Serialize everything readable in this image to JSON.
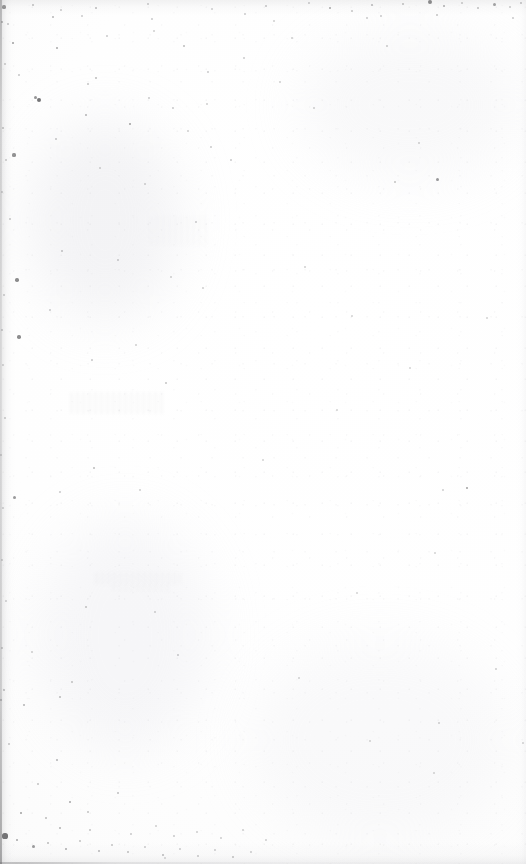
{
  "page": {
    "kind": "scanned-blank-page",
    "width": 526,
    "height": 864,
    "visible_text": "",
    "text_content_present": false
  },
  "colors": {
    "paper_white": "#fefefe",
    "paper_offwhite": "#fafafa",
    "speck_dark": "#3b3b3d",
    "speck_mid": "#8a8a8d",
    "speck_light": "#c4c4c8",
    "edge_shadow": "#96969a",
    "ghost_smudge": "#d8d8dc"
  },
  "artifacts": {
    "left_gutter_shadow": true,
    "top_dust_band": true,
    "bottom_edge_band": true,
    "right_edge_faint": true,
    "ghost_smudges": [
      {
        "x": 70,
        "y": 392,
        "w": 96,
        "h": 22,
        "opacity": 0.16
      },
      {
        "x": 95,
        "y": 572,
        "w": 86,
        "h": 13,
        "opacity": 0.14
      },
      {
        "x": 112,
        "y": 584,
        "w": 58,
        "h": 8,
        "opacity": 0.1
      },
      {
        "x": 150,
        "y": 216,
        "w": 60,
        "h": 30,
        "opacity": 0.08
      }
    ],
    "blotches": [
      {
        "x": 30,
        "y": 120,
        "w": 150,
        "h": 200,
        "color": "rgba(228,228,232,0.40)"
      },
      {
        "x": 40,
        "y": 520,
        "w": 170,
        "h": 230,
        "color": "rgba(232,232,236,0.34)"
      },
      {
        "x": 300,
        "y": 30,
        "w": 220,
        "h": 150,
        "color": "rgba(234,234,238,0.30)"
      },
      {
        "x": 250,
        "y": 640,
        "w": 260,
        "h": 200,
        "color": "rgba(236,236,240,0.26)"
      }
    ],
    "specks": [
      {
        "x": 4,
        "y": 7,
        "r": 1.6,
        "o": 0.62
      },
      {
        "x": 33,
        "y": 5,
        "r": 1.0,
        "o": 0.34
      },
      {
        "x": 61,
        "y": 10,
        "r": 0.9,
        "o": 0.28
      },
      {
        "x": 96,
        "y": 8,
        "r": 1.1,
        "o": 0.36
      },
      {
        "x": 148,
        "y": 4,
        "r": 1.0,
        "o": 0.3
      },
      {
        "x": 212,
        "y": 9,
        "r": 0.8,
        "o": 0.24
      },
      {
        "x": 266,
        "y": 6,
        "r": 1.0,
        "o": 0.32
      },
      {
        "x": 309,
        "y": 3,
        "r": 0.9,
        "o": 0.28
      },
      {
        "x": 330,
        "y": 8,
        "r": 1.4,
        "o": 0.48
      },
      {
        "x": 352,
        "y": 11,
        "r": 1.0,
        "o": 0.3
      },
      {
        "x": 372,
        "y": 5,
        "r": 1.2,
        "o": 0.38
      },
      {
        "x": 403,
        "y": 4,
        "r": 1.1,
        "o": 0.34
      },
      {
        "x": 430,
        "y": 2,
        "r": 1.9,
        "o": 0.64
      },
      {
        "x": 444,
        "y": 6,
        "r": 1.3,
        "o": 0.44
      },
      {
        "x": 462,
        "y": 3,
        "r": 1.0,
        "o": 0.3
      },
      {
        "x": 478,
        "y": 8,
        "r": 1.1,
        "o": 0.34
      },
      {
        "x": 494,
        "y": 4,
        "r": 1.5,
        "o": 0.5
      },
      {
        "x": 510,
        "y": 7,
        "r": 1.0,
        "o": 0.3
      },
      {
        "x": 521,
        "y": 3,
        "r": 1.2,
        "o": 0.36
      },
      {
        "x": 2,
        "y": 22,
        "r": 1.3,
        "o": 0.44
      },
      {
        "x": 8,
        "y": 24,
        "r": 1.0,
        "o": 0.32
      },
      {
        "x": 53,
        "y": 17,
        "r": 1.1,
        "o": 0.36
      },
      {
        "x": 82,
        "y": 16,
        "r": 0.8,
        "o": 0.24
      },
      {
        "x": 152,
        "y": 19,
        "r": 0.9,
        "o": 0.26
      },
      {
        "x": 245,
        "y": 14,
        "r": 0.9,
        "o": 0.26
      },
      {
        "x": 274,
        "y": 21,
        "r": 0.8,
        "o": 0.22
      },
      {
        "x": 367,
        "y": 18,
        "r": 0.8,
        "o": 0.24
      },
      {
        "x": 381,
        "y": 16,
        "r": 0.9,
        "o": 0.26
      },
      {
        "x": 437,
        "y": 15,
        "r": 1.0,
        "o": 0.3
      },
      {
        "x": 513,
        "y": 18,
        "r": 0.9,
        "o": 0.26
      },
      {
        "x": 13,
        "y": 43,
        "r": 1.4,
        "o": 0.5
      },
      {
        "x": 39,
        "y": 100,
        "r": 2.0,
        "o": 0.7
      },
      {
        "x": 19,
        "y": 75,
        "r": 0.9,
        "o": 0.28
      },
      {
        "x": 5,
        "y": 64,
        "r": 1.0,
        "o": 0.3
      },
      {
        "x": 3,
        "y": 128,
        "r": 1.1,
        "o": 0.34
      },
      {
        "x": 14,
        "y": 155,
        "r": 1.6,
        "o": 0.56
      },
      {
        "x": 6,
        "y": 160,
        "r": 1.0,
        "o": 0.3
      },
      {
        "x": 2,
        "y": 192,
        "r": 0.9,
        "o": 0.28
      },
      {
        "x": 10,
        "y": 219,
        "r": 1.0,
        "o": 0.3
      },
      {
        "x": 17,
        "y": 280,
        "r": 1.7,
        "o": 0.58
      },
      {
        "x": 4,
        "y": 295,
        "r": 1.0,
        "o": 0.3
      },
      {
        "x": 2,
        "y": 330,
        "r": 1.1,
        "o": 0.32
      },
      {
        "x": 19,
        "y": 337,
        "r": 1.7,
        "o": 0.58
      },
      {
        "x": 3,
        "y": 365,
        "r": 0.9,
        "o": 0.26
      },
      {
        "x": 5,
        "y": 418,
        "r": 1.0,
        "o": 0.3
      },
      {
        "x": 1,
        "y": 455,
        "r": 0.9,
        "o": 0.28
      },
      {
        "x": 14,
        "y": 497,
        "r": 1.5,
        "o": 0.52
      },
      {
        "x": 3,
        "y": 508,
        "r": 0.9,
        "o": 0.26
      },
      {
        "x": 2,
        "y": 560,
        "r": 1.0,
        "o": 0.28
      },
      {
        "x": 6,
        "y": 601,
        "r": 0.9,
        "o": 0.26
      },
      {
        "x": 2,
        "y": 648,
        "r": 1.1,
        "o": 0.32
      },
      {
        "x": 4,
        "y": 690,
        "r": 1.2,
        "o": 0.36
      },
      {
        "x": 1,
        "y": 700,
        "r": 1.3,
        "o": 0.42
      },
      {
        "x": 9,
        "y": 744,
        "r": 1.0,
        "o": 0.3
      },
      {
        "x": 57,
        "y": 48,
        "r": 1.3,
        "o": 0.44
      },
      {
        "x": 107,
        "y": 36,
        "r": 0.9,
        "o": 0.26
      },
      {
        "x": 154,
        "y": 31,
        "r": 0.8,
        "o": 0.22
      },
      {
        "x": 184,
        "y": 46,
        "r": 1.1,
        "o": 0.34
      },
      {
        "x": 208,
        "y": 72,
        "r": 0.9,
        "o": 0.26
      },
      {
        "x": 244,
        "y": 58,
        "r": 0.8,
        "o": 0.24
      },
      {
        "x": 86,
        "y": 115,
        "r": 1.2,
        "o": 0.38
      },
      {
        "x": 130,
        "y": 124,
        "r": 1.4,
        "o": 0.48
      },
      {
        "x": 173,
        "y": 108,
        "r": 0.9,
        "o": 0.26
      },
      {
        "x": 88,
        "y": 84,
        "r": 1.0,
        "o": 0.3
      },
      {
        "x": 96,
        "y": 78,
        "r": 1.1,
        "o": 0.34
      },
      {
        "x": 188,
        "y": 131,
        "r": 0.8,
        "o": 0.22
      },
      {
        "x": 207,
        "y": 104,
        "r": 0.8,
        "o": 0.22
      },
      {
        "x": 149,
        "y": 98,
        "r": 0.9,
        "o": 0.26
      },
      {
        "x": 35,
        "y": 97,
        "r": 1.5,
        "o": 0.54
      },
      {
        "x": 211,
        "y": 147,
        "r": 0.9,
        "o": 0.26
      },
      {
        "x": 100,
        "y": 168,
        "r": 0.8,
        "o": 0.22
      },
      {
        "x": 56,
        "y": 139,
        "r": 1.0,
        "o": 0.3
      },
      {
        "x": 145,
        "y": 184,
        "r": 0.8,
        "o": 0.22
      },
      {
        "x": 196,
        "y": 222,
        "r": 0.9,
        "o": 0.26
      },
      {
        "x": 62,
        "y": 251,
        "r": 1.0,
        "o": 0.3
      },
      {
        "x": 118,
        "y": 260,
        "r": 0.9,
        "o": 0.26
      },
      {
        "x": 171,
        "y": 277,
        "r": 0.8,
        "o": 0.22
      },
      {
        "x": 203,
        "y": 288,
        "r": 0.8,
        "o": 0.22
      },
      {
        "x": 50,
        "y": 310,
        "r": 0.9,
        "o": 0.26
      },
      {
        "x": 136,
        "y": 345,
        "r": 0.8,
        "o": 0.22
      },
      {
        "x": 92,
        "y": 360,
        "r": 0.9,
        "o": 0.26
      },
      {
        "x": 166,
        "y": 383,
        "r": 1.0,
        "o": 0.3
      },
      {
        "x": 94,
        "y": 468,
        "r": 1.1,
        "o": 0.34
      },
      {
        "x": 60,
        "y": 492,
        "r": 0.9,
        "o": 0.26
      },
      {
        "x": 140,
        "y": 490,
        "r": 0.8,
        "o": 0.22
      },
      {
        "x": 86,
        "y": 607,
        "r": 1.0,
        "o": 0.3
      },
      {
        "x": 155,
        "y": 612,
        "r": 0.8,
        "o": 0.22
      },
      {
        "x": 178,
        "y": 655,
        "r": 0.9,
        "o": 0.26
      },
      {
        "x": 72,
        "y": 682,
        "r": 1.0,
        "o": 0.3
      },
      {
        "x": 231,
        "y": 160,
        "r": 0.9,
        "o": 0.26
      },
      {
        "x": 280,
        "y": 82,
        "r": 0.8,
        "o": 0.22
      },
      {
        "x": 314,
        "y": 108,
        "r": 0.8,
        "o": 0.22
      },
      {
        "x": 387,
        "y": 46,
        "r": 0.9,
        "o": 0.26
      },
      {
        "x": 292,
        "y": 38,
        "r": 0.8,
        "o": 0.22
      },
      {
        "x": 419,
        "y": 143,
        "r": 0.8,
        "o": 0.22
      },
      {
        "x": 395,
        "y": 182,
        "r": 1.0,
        "o": 0.3
      },
      {
        "x": 437,
        "y": 179,
        "r": 1.5,
        "o": 0.52
      },
      {
        "x": 467,
        "y": 488,
        "r": 1.4,
        "o": 0.48
      },
      {
        "x": 443,
        "y": 490,
        "r": 0.9,
        "o": 0.24
      },
      {
        "x": 305,
        "y": 267,
        "r": 0.8,
        "o": 0.22
      },
      {
        "x": 352,
        "y": 316,
        "r": 0.8,
        "o": 0.2
      },
      {
        "x": 410,
        "y": 368,
        "r": 0.8,
        "o": 0.2
      },
      {
        "x": 487,
        "y": 318,
        "r": 0.8,
        "o": 0.2
      },
      {
        "x": 337,
        "y": 410,
        "r": 0.8,
        "o": 0.2
      },
      {
        "x": 263,
        "y": 460,
        "r": 0.8,
        "o": 0.2
      },
      {
        "x": 435,
        "y": 553,
        "r": 0.8,
        "o": 0.2
      },
      {
        "x": 357,
        "y": 593,
        "r": 0.8,
        "o": 0.2
      },
      {
        "x": 299,
        "y": 678,
        "r": 0.8,
        "o": 0.2
      },
      {
        "x": 439,
        "y": 723,
        "r": 0.8,
        "o": 0.22
      },
      {
        "x": 496,
        "y": 669,
        "r": 0.9,
        "o": 0.24
      },
      {
        "x": 370,
        "y": 741,
        "r": 0.8,
        "o": 0.2
      },
      {
        "x": 434,
        "y": 773,
        "r": 0.8,
        "o": 0.2
      },
      {
        "x": 523,
        "y": 743,
        "r": 0.9,
        "o": 0.24
      },
      {
        "x": 32,
        "y": 652,
        "r": 0.8,
        "o": 0.22
      },
      {
        "x": 60,
        "y": 697,
        "r": 1.1,
        "o": 0.34
      },
      {
        "x": 24,
        "y": 705,
        "r": 1.2,
        "o": 0.38
      },
      {
        "x": 118,
        "y": 793,
        "r": 1.0,
        "o": 0.32
      },
      {
        "x": 57,
        "y": 760,
        "r": 1.2,
        "o": 0.38
      },
      {
        "x": 38,
        "y": 784,
        "r": 1.0,
        "o": 0.3
      },
      {
        "x": 70,
        "y": 802,
        "r": 1.3,
        "o": 0.44
      },
      {
        "x": 21,
        "y": 813,
        "r": 1.4,
        "o": 0.48
      },
      {
        "x": 46,
        "y": 818,
        "r": 1.1,
        "o": 0.34
      },
      {
        "x": 88,
        "y": 812,
        "r": 1.0,
        "o": 0.3
      },
      {
        "x": 60,
        "y": 828,
        "r": 1.2,
        "o": 0.4
      },
      {
        "x": 5,
        "y": 836,
        "r": 2.6,
        "o": 0.78
      },
      {
        "x": 17,
        "y": 840,
        "r": 1.3,
        "o": 0.44
      },
      {
        "x": 33,
        "y": 846,
        "r": 1.5,
        "o": 0.52
      },
      {
        "x": 48,
        "y": 843,
        "r": 1.1,
        "o": 0.34
      },
      {
        "x": 66,
        "y": 849,
        "r": 1.3,
        "o": 0.44
      },
      {
        "x": 80,
        "y": 841,
        "r": 1.0,
        "o": 0.3
      },
      {
        "x": 99,
        "y": 851,
        "r": 1.2,
        "o": 0.38
      },
      {
        "x": 112,
        "y": 845,
        "r": 1.0,
        "o": 0.3
      },
      {
        "x": 128,
        "y": 852,
        "r": 1.1,
        "o": 0.34
      },
      {
        "x": 145,
        "y": 847,
        "r": 0.9,
        "o": 0.26
      },
      {
        "x": 163,
        "y": 855,
        "r": 1.2,
        "o": 0.38
      },
      {
        "x": 180,
        "y": 849,
        "r": 0.9,
        "o": 0.26
      },
      {
        "x": 198,
        "y": 856,
        "r": 1.0,
        "o": 0.3
      },
      {
        "x": 215,
        "y": 850,
        "r": 0.9,
        "o": 0.26
      },
      {
        "x": 233,
        "y": 857,
        "r": 1.1,
        "o": 0.34
      },
      {
        "x": 251,
        "y": 852,
        "r": 0.9,
        "o": 0.26
      },
      {
        "x": 90,
        "y": 830,
        "r": 1.0,
        "o": 0.3
      },
      {
        "x": 131,
        "y": 834,
        "r": 0.9,
        "o": 0.26
      },
      {
        "x": 156,
        "y": 826,
        "r": 0.8,
        "o": 0.22
      },
      {
        "x": 174,
        "y": 836,
        "r": 0.9,
        "o": 0.26
      },
      {
        "x": 197,
        "y": 832,
        "r": 0.8,
        "o": 0.22
      },
      {
        "x": 221,
        "y": 838,
        "r": 0.9,
        "o": 0.24
      },
      {
        "x": 243,
        "y": 830,
        "r": 0.8,
        "o": 0.22
      },
      {
        "x": 266,
        "y": 840,
        "r": 0.9,
        "o": 0.24
      },
      {
        "x": 165,
        "y": 858,
        "r": 0.8,
        "o": 0.22
      }
    ]
  }
}
